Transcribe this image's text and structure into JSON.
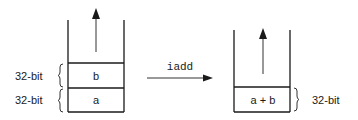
{
  "diagram": {
    "type": "stack-operation",
    "instruction": "iadd",
    "before_stack": {
      "cells_top_to_bottom": [
        "b",
        "a"
      ],
      "size_labels": [
        "32-bit",
        "32-bit"
      ]
    },
    "after_stack": {
      "cells_top_to_bottom": [
        "a + b"
      ],
      "size_labels": [
        "32-bit"
      ]
    }
  },
  "colors": {
    "line": "#1a1a1a",
    "background": "#ffffff"
  }
}
